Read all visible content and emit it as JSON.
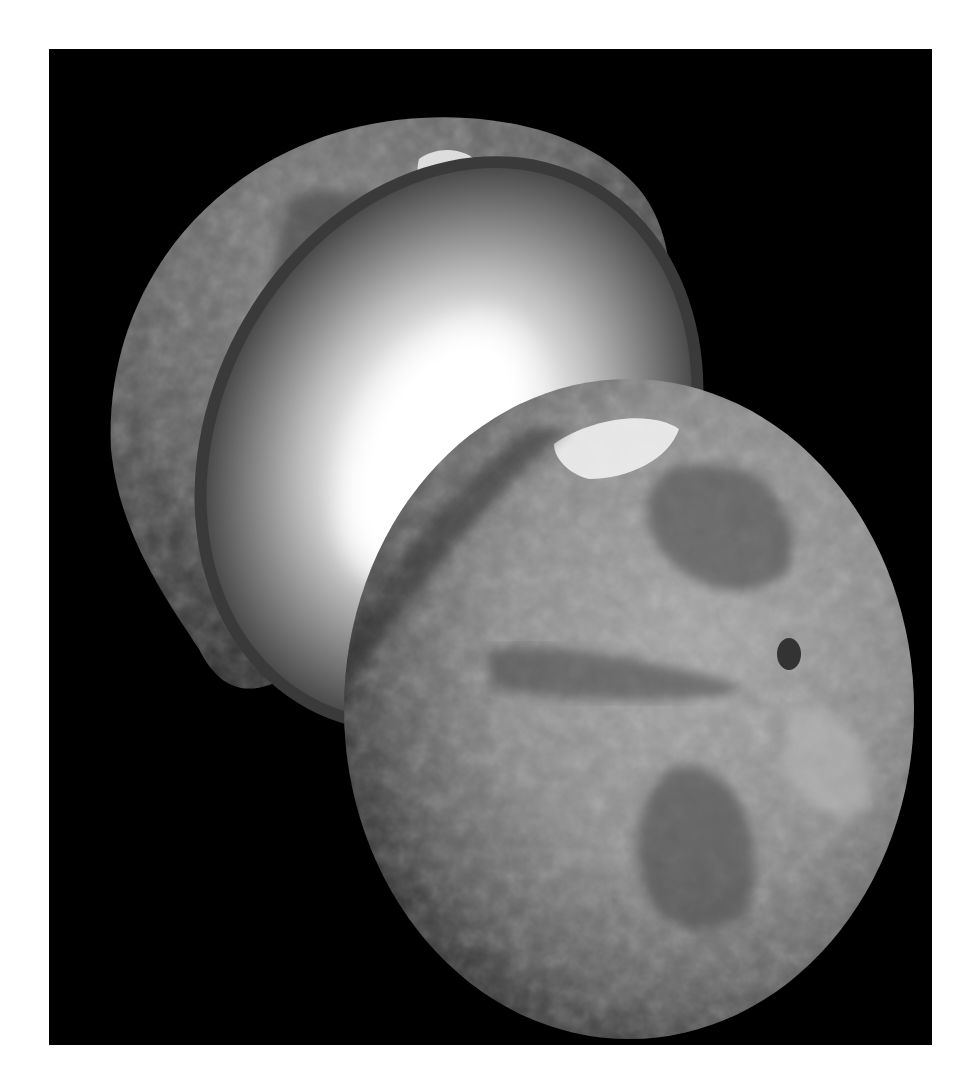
{
  "image": {
    "subject": "Cutaway illustration of Mars showing interior layers",
    "style": "grayscale",
    "background_color": "#000000",
    "border_color": "#ffffff"
  },
  "elements": {
    "upper_hemisphere": {
      "surface_color": "#6a6a6a",
      "cap_color": "#e8e8e8",
      "crust_color": "#3c3c3c"
    },
    "mantle": {
      "outer_color": "#3a3a3a",
      "inner_color": "#c8c8c8"
    },
    "core": {
      "color": "#ffffff"
    },
    "lower_hemisphere": {
      "surface_light": "#9a9a9a",
      "surface_dark": "#555555",
      "cap_color": "#efefef"
    }
  }
}
